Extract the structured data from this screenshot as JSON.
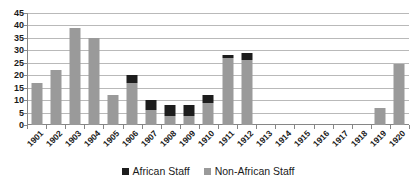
{
  "chart_data": {
    "type": "bar",
    "barmode": "stacked",
    "title": "",
    "subtitle": "",
    "xlabel": "",
    "ylabel": "",
    "ylim": [
      0,
      45
    ],
    "ytick_step": 5,
    "yticks": [
      45,
      40,
      35,
      30,
      25,
      20,
      15,
      10,
      5,
      0
    ],
    "grid": true,
    "grid_axis": "y",
    "legend_position": "bottom-center",
    "categories": [
      "1901",
      "1902",
      "1903",
      "1904",
      "1905",
      "1906",
      "1907",
      "1908",
      "1909",
      "1910",
      "1911",
      "1912",
      "1913",
      "1914",
      "1915",
      "1916",
      "1917",
      "1918",
      "1919",
      "1920"
    ],
    "series": [
      {
        "name": "Non-African Staff",
        "color": "#9a9a9a",
        "values": [
          17,
          22,
          39,
          35,
          12,
          17,
          6,
          3.5,
          3.5,
          9,
          27,
          26,
          0,
          0,
          0,
          0,
          0,
          0,
          7,
          24.5
        ]
      },
      {
        "name": "African Staff",
        "color": "#1d1d1d",
        "values": [
          0,
          0,
          0,
          0,
          0,
          3,
          4,
          4.5,
          4.5,
          3,
          1,
          3,
          0,
          0,
          0,
          0,
          0,
          0,
          0,
          0
        ]
      }
    ],
    "totals": [
      17,
      22,
      39,
      35,
      12,
      20,
      10,
      8,
      8,
      12,
      28,
      29,
      0,
      0,
      0,
      0,
      0,
      0,
      7,
      24.5
    ]
  },
  "legend": {
    "entries": [
      {
        "label": "African Staff",
        "swatch": "african"
      },
      {
        "label": "Non-African Staff",
        "swatch": "nonafrican"
      }
    ]
  }
}
